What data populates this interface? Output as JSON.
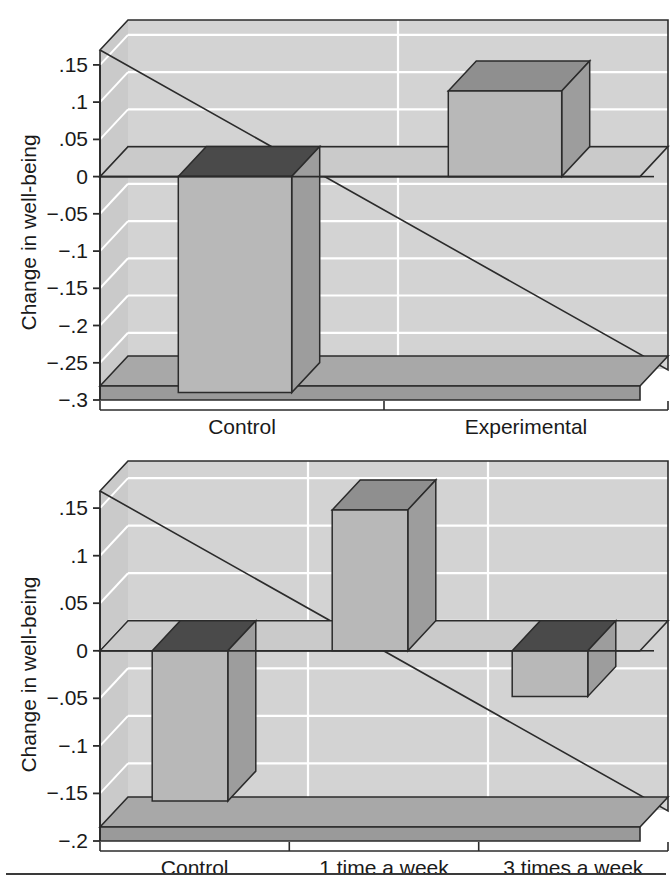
{
  "figure": {
    "background_color": "#ffffff",
    "panel_count": 2,
    "has_bottom_rule": true
  },
  "palette": {
    "wall_back": "#d3d3d3",
    "wall_side": "#cacaca",
    "floor_top": "#a8a8a8",
    "floor_front": "#9a9a9a",
    "gridline": "#ffffff",
    "outline": "#2b2b2b",
    "bar_front": "#b8b8b8",
    "bar_side": "#9d9d9d",
    "bar_top_positive": "#8f8f8f",
    "bar_top_negative": "#4a4a4a",
    "text": "#1a1a1a"
  },
  "chart_data": [
    {
      "type": "bar",
      "panel": "top",
      "title": "",
      "xlabel": "",
      "ylabel": "Change in well-being",
      "categories": [
        "Control",
        "Experimental"
      ],
      "values": [
        -0.29,
        0.115
      ],
      "ylim": [
        -0.3,
        0.17
      ],
      "yticks": [
        0.15,
        0.1,
        0.05,
        0,
        -0.05,
        -0.1,
        -0.15,
        -0.2,
        -0.25,
        -0.3
      ],
      "ytick_labels": [
        ".15",
        ".1",
        ".05",
        "0",
        "−.05",
        "−.1",
        "−.15",
        "−.2",
        "−.25",
        "−.3"
      ],
      "grid": true,
      "legend": "none",
      "style": "3d-bar"
    },
    {
      "type": "bar",
      "panel": "bottom",
      "title": "",
      "xlabel": "",
      "ylabel": "Change in well-being",
      "categories": [
        "Control",
        "1 time a week",
        "3 times a week"
      ],
      "values": [
        -0.158,
        0.148,
        -0.048
      ],
      "ylim": [
        -0.2,
        0.168
      ],
      "yticks": [
        0.15,
        0.1,
        0.05,
        0,
        -0.05,
        -0.1,
        -0.15,
        -0.2
      ],
      "ytick_labels": [
        ".15",
        ".1",
        ".05",
        "0",
        "−.05",
        "−.1",
        "−.15",
        "−.2"
      ],
      "grid": true,
      "legend": "none",
      "style": "3d-bar"
    }
  ]
}
